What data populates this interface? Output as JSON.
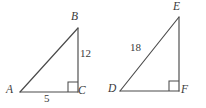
{
  "figure": {
    "background_color": "#ffffff",
    "stroke_color": "#4a4a4a",
    "text_color": "#3a3a3a"
  },
  "triangles": [
    {
      "name": "triangle-abc",
      "vertices": [
        {
          "label": "A",
          "x": 20,
          "y": 92
        },
        {
          "label": "B",
          "x": 78,
          "y": 28
        },
        {
          "label": "C",
          "x": 78,
          "y": 92
        }
      ],
      "right_angle_at": "C",
      "side_labels": [
        {
          "name": "side-ac",
          "value": "5"
        },
        {
          "name": "side-bc",
          "value": "12"
        }
      ]
    },
    {
      "name": "triangle-def",
      "vertices": [
        {
          "label": "D",
          "x": 120,
          "y": 91
        },
        {
          "label": "E",
          "x": 179,
          "y": 17
        },
        {
          "label": "F",
          "x": 179,
          "y": 91
        }
      ],
      "right_angle_at": "F",
      "side_labels": [
        {
          "name": "side-de",
          "value": "18"
        }
      ]
    }
  ],
  "labels": {
    "A": "A",
    "B": "B",
    "C": "C",
    "D": "D",
    "E": "E",
    "F": "F",
    "side_ac": "5",
    "side_bc": "12",
    "side_de": "18"
  }
}
